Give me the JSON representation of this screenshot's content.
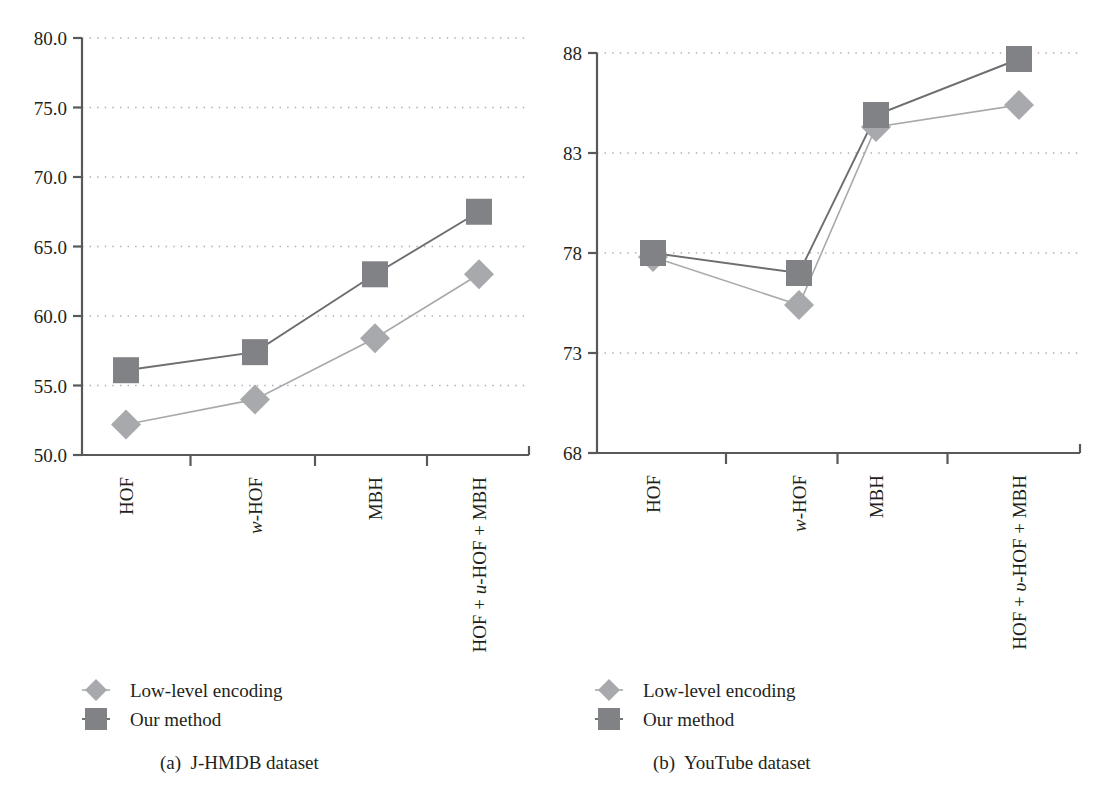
{
  "figure": {
    "series_labels": [
      "Low-level encoding",
      "Our method"
    ],
    "colors": {
      "our_method": "#808285",
      "low_level": "#a7a9ac",
      "axis": "#58595b",
      "grid": "#b9a6b4"
    }
  },
  "panel_a": {
    "caption": "(a)  J-HMDB dataset",
    "legend": [
      "Low-level encoding",
      "Our method"
    ]
  },
  "panel_b": {
    "caption": "(b)  YouTube dataset",
    "legend": [
      "Low-level encoding",
      "Our method"
    ]
  },
  "chart_data": [
    {
      "type": "line",
      "title": "(a)  J-HMDB dataset",
      "xlabel": "",
      "ylabel": "",
      "categories": [
        "HOF",
        "w-HOF",
        "MBH",
        "HOF + u-HOF + MBH"
      ],
      "categories_rich": [
        [
          {
            "t": "HOF",
            "i": false
          }
        ],
        [
          {
            "t": "w",
            "i": true
          },
          {
            "t": "-HOF",
            "i": false
          }
        ],
        [
          {
            "t": "MBH",
            "i": false
          }
        ],
        [
          {
            "t": "HOF + ",
            "i": false
          },
          {
            "t": "u",
            "i": true
          },
          {
            "t": "-HOF + MBH",
            "i": false
          }
        ]
      ],
      "ylim": [
        50.0,
        80.0
      ],
      "yticks": [
        50.0,
        55.0,
        60.0,
        65.0,
        70.0,
        75.0,
        80.0
      ],
      "ytick_labels": [
        "50.0",
        "55.0",
        "60.0",
        "65.0",
        "70.0",
        "75.0",
        "80.0"
      ],
      "grid": true,
      "legend_position": "below-left",
      "series": [
        {
          "name": "Low-level encoding",
          "marker": "diamond",
          "values": [
            52.2,
            54.0,
            58.4,
            63.0
          ]
        },
        {
          "name": "Our method",
          "marker": "square",
          "values": [
            56.1,
            57.4,
            63.0,
            67.5
          ]
        }
      ]
    },
    {
      "type": "line",
      "title": "(b)  YouTube dataset",
      "xlabel": "",
      "ylabel": "",
      "categories": [
        "HOF",
        "w-HOF",
        "MBH",
        "HOF + v-HOF + MBH"
      ],
      "categories_rich": [
        [
          {
            "t": "HOF",
            "i": false
          }
        ],
        [
          {
            "t": "w",
            "i": true
          },
          {
            "t": "-HOF",
            "i": false
          }
        ],
        [
          {
            "t": "MBH",
            "i": false
          }
        ],
        [
          {
            "t": "HOF + ",
            "i": false
          },
          {
            "t": "υ",
            "i": true
          },
          {
            "t": "-HOF + MBH",
            "i": false
          }
        ]
      ],
      "ylim": [
        68,
        88
      ],
      "yticks": [
        68,
        73,
        78,
        83,
        88
      ],
      "ytick_labels": [
        "68",
        "73",
        "78",
        "83",
        "88"
      ],
      "grid": true,
      "legend_position": "below-left",
      "series": [
        {
          "name": "Low-level encoding",
          "marker": "diamond",
          "values": [
            77.8,
            75.4,
            84.3,
            85.4
          ]
        },
        {
          "name": "Our method",
          "marker": "square",
          "values": [
            78.0,
            77.0,
            84.9,
            87.7
          ]
        }
      ]
    }
  ]
}
